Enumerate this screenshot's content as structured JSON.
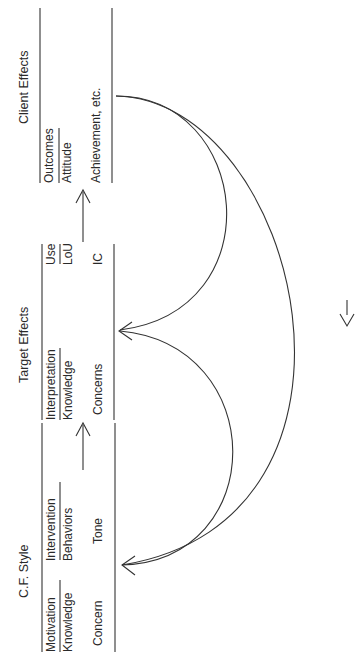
{
  "diagram": {
    "orientation": "rotated-90-ccw",
    "colors": {
      "line": "#333333",
      "text": "#2a2a2a",
      "background": "#ffffff"
    },
    "columns": [
      {
        "title": "C.F. Style",
        "groups": [
          {
            "header": "Motivation",
            "sub": "Knowledge",
            "item": "Concern"
          },
          {
            "header": "Intervention",
            "sub": "Behaviors",
            "item": "Tone"
          }
        ]
      },
      {
        "title": "Target Effects",
        "groups": [
          {
            "header": "Interpretation",
            "sub": "Knowledge",
            "item": "Concerns"
          },
          {
            "header": "Use",
            "sub": "LoU",
            "item": "IC"
          }
        ]
      },
      {
        "title": "Client Effects",
        "groups": [
          {
            "header": "Outcomes",
            "sub": "Attitude",
            "item": "Achievement, etc."
          }
        ]
      }
    ],
    "arrows": [
      {
        "from": "C.F. Style",
        "to": "Target Effects",
        "type": "straight"
      },
      {
        "from": "Target Effects",
        "to": "Client Effects",
        "type": "straight"
      },
      {
        "from": "Client Effects",
        "to": "Target Effects",
        "type": "feedback-arc"
      },
      {
        "from": "Target Effects",
        "to": "C.F. Style",
        "type": "feedback-arc"
      },
      {
        "from": "Client Effects",
        "to": "C.F. Style",
        "type": "feedback-arc"
      }
    ]
  }
}
